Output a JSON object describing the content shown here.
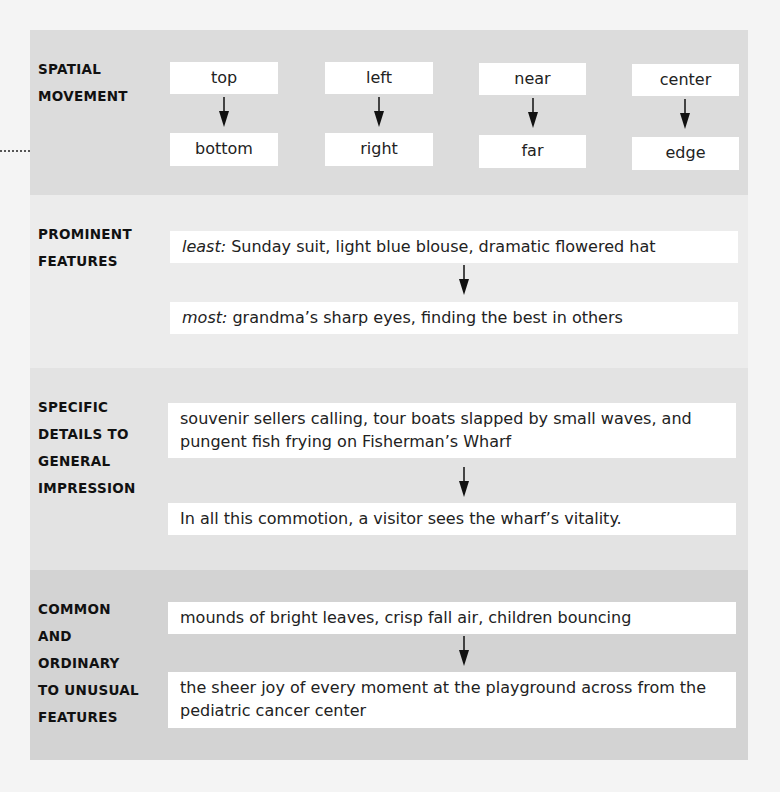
{
  "sections": [
    {
      "label": "SPATIAL\nMOVEMENT",
      "pairs": [
        {
          "from": "top",
          "to": "bottom"
        },
        {
          "from": "left",
          "to": "right"
        },
        {
          "from": "near",
          "to": "far"
        },
        {
          "from": "center",
          "to": "edge"
        }
      ]
    },
    {
      "label": "PROMINENT\nFEATURES",
      "from_prefix": "least:",
      "from_text": " Sunday suit, light blue blouse, dramatic flowered hat",
      "to_prefix": "most:",
      "to_text": " grandma’s sharp eyes, finding the best in others"
    },
    {
      "label": "SPECIFIC\nDETAILS TO\nGENERAL\nIMPRESSION",
      "from_text": "souvenir sellers calling, tour boats slapped by small waves, and pungent fish frying on Fisherman’s Wharf",
      "to_text": "In all this commotion, a visitor sees the wharf’s vitality."
    },
    {
      "label": "COMMON\nAND\nORDINARY\nTO UNUSUAL\nFEATURES",
      "from_text": "mounds of bright leaves, crisp fall air, children bouncing",
      "to_text": "the sheer joy of every moment at the playground across from the pediatric cancer center"
    }
  ],
  "icons": {
    "arrow": "down-arrow",
    "connector": "dotted-line-with-dot"
  },
  "colors": {
    "section1_bg": "#dcdcdc",
    "section2_bg": "#ececec",
    "section3_bg": "#e3e3e3",
    "section4_bg": "#d3d3d3",
    "box_bg": "#ffffff"
  }
}
